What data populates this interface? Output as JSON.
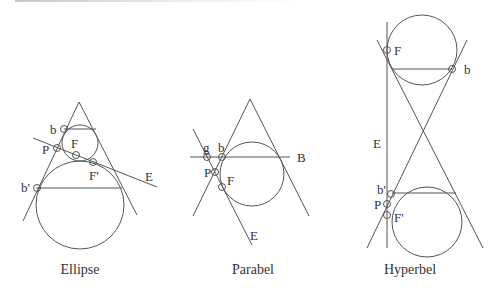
{
  "figures": [
    {
      "caption": "Ellipse",
      "labels": {
        "b": "b",
        "P": "P",
        "F": "F",
        "F2": "F'",
        "E": "E",
        "b2": "b'"
      }
    },
    {
      "caption": "Parabel",
      "labels": {
        "g": "g",
        "b": "b",
        "P": "P",
        "F": "F",
        "B": "B",
        "E": "E"
      }
    },
    {
      "caption": "Hyperbel",
      "labels": {
        "F": "F",
        "b": "b",
        "E": "E",
        "b2": "b'",
        "P": "P",
        "F2": "F'"
      }
    }
  ],
  "colors": {
    "line": "#555555",
    "text": "#333333",
    "background": "#ffffff"
  }
}
